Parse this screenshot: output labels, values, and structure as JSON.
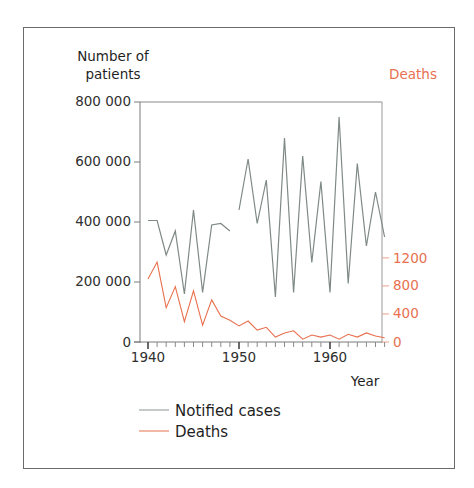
{
  "chart_data": {
    "type": "line",
    "title": "",
    "xlabel": "Year",
    "ylabel_left": "Number of patients",
    "ylabel_right": "Deaths",
    "xlim": [
      1940,
      1966
    ],
    "ylim_left": [
      0,
      800000
    ],
    "ylim_right": [
      0,
      1200
    ],
    "x_ticks": [
      1940,
      1950,
      1960
    ],
    "y_ticks_left": [
      0,
      200000,
      400000,
      600000,
      800000
    ],
    "y_tick_labels_left": [
      "0",
      "200 000",
      "400 000",
      "600 000",
      "800 000"
    ],
    "y_ticks_right": [
      0,
      400,
      800,
      1200
    ],
    "y_tick_labels_right": [
      "0",
      "400",
      "800",
      "1200"
    ],
    "grid": false,
    "legend_position": "bottom-left",
    "series": [
      {
        "name": "Notified cases",
        "axis": "left",
        "color": "#7f8a85",
        "segments": [
          {
            "x": [
              1940,
              1941,
              1942,
              1943,
              1944,
              1945,
              1946,
              1947,
              1948,
              1949
            ],
            "values": [
              405000,
              405000,
              290000,
              370000,
              160000,
              440000,
              165000,
              390000,
              395000,
              370000
            ]
          },
          {
            "x": [
              1950,
              1951,
              1952,
              1953,
              1954,
              1955,
              1956,
              1957,
              1958,
              1959,
              1960,
              1961,
              1962,
              1963,
              1964,
              1965,
              1966
            ],
            "values": [
              440000,
              610000,
              395000,
              540000,
              150000,
              680000,
              165000,
              620000,
              265000,
              535000,
              165000,
              750000,
              195000,
              595000,
              320000,
              500000,
              350000
            ],
            "note": "continues"
          }
        ]
      },
      {
        "name": "Deaths",
        "axis": "right",
        "color": "#e8704f",
        "x": [
          1940,
          1941,
          1942,
          1943,
          1944,
          1945,
          1946,
          1947,
          1948,
          1949,
          1950,
          1951,
          1952,
          1953,
          1954,
          1955,
          1956,
          1957,
          1958,
          1959,
          1960,
          1961,
          1962,
          1963,
          1964,
          1965,
          1966
        ],
        "values": [
          900,
          1140,
          490,
          790,
          290,
          730,
          240,
          600,
          370,
          310,
          230,
          300,
          170,
          210,
          70,
          130,
          160,
          40,
          100,
          70,
          100,
          40,
          110,
          70,
          130,
          85,
          60
        ]
      }
    ]
  },
  "legend": {
    "items": [
      {
        "label": "Notified cases",
        "color": "#7f8a85"
      },
      {
        "label": "Deaths",
        "color": "#e8704f"
      }
    ]
  },
  "axes": {
    "left_title_line1": "Number of",
    "left_title_line2": "patients",
    "right_title": "Deaths",
    "x_title": "Year",
    "x_tick_labels": [
      "1940",
      "1950",
      "1960"
    ],
    "left_tick_labels": [
      "800 000",
      "600 000",
      "400 000",
      "200 000",
      "0"
    ],
    "right_tick_labels": [
      "1200",
      "800",
      "400",
      "0"
    ]
  }
}
